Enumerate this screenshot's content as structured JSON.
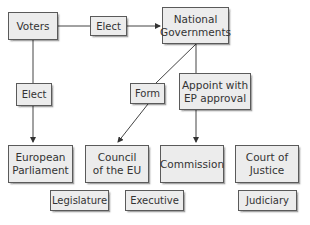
{
  "diagram": {
    "nodes": {
      "voters": "Voters",
      "national_governments": "National Governments",
      "european_parliament": "European Parliament",
      "council": "Council of the EU",
      "commission": "Commission",
      "court_of_justice": "Court of Justice"
    },
    "edge_labels": {
      "voters_to_ng": "Elect",
      "voters_to_ep": "Elect",
      "ng_to_council": "Form",
      "ng_to_commission": "Appoint with EP approval"
    },
    "branch_labels": {
      "legislature": "Legislature",
      "executive": "Executive",
      "judiciary": "Judiciary"
    },
    "colors": {
      "box_fill": "#ececec",
      "box_border": "#5a5a5a",
      "line": "#444444",
      "text": "#333333"
    }
  }
}
